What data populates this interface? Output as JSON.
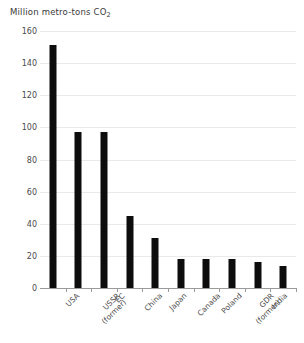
{
  "chart_data": {
    "type": "bar",
    "title": "Million metro-tons CO2",
    "title_prefix": "Million metro-tons CO",
    "title_subscript": "2",
    "xlabel": "",
    "ylabel": "Million metro-tons CO2",
    "ylim": [
      0,
      160
    ],
    "ytick_values": [
      0,
      20,
      40,
      60,
      80,
      100,
      120,
      140,
      160
    ],
    "ytick_labels": [
      "0",
      "20",
      "40",
      "60",
      "80",
      "100",
      "120",
      "140",
      "160"
    ],
    "grid": true,
    "legend": "none",
    "categories": [
      "USA",
      "USSR (former)",
      "EC",
      "China",
      "Japan",
      "Canada",
      "Poland",
      "GDR (former)",
      "India",
      "Czechoslovakia (former)"
    ],
    "category_lines": [
      [
        "USA"
      ],
      [
        "USSR",
        "(former)"
      ],
      [
        "EC"
      ],
      [
        "China"
      ],
      [
        "Japan"
      ],
      [
        "Canada"
      ],
      [
        "Poland"
      ],
      [
        "GDR",
        "(former)"
      ],
      [
        "India"
      ],
      [
        "Czechoslovakia",
        "(former)"
      ]
    ],
    "values": [
      151,
      97,
      97,
      45,
      31,
      18,
      18,
      18,
      16,
      14
    ],
    "bar_color": "#0d0d0d",
    "grid_color": "#e9e9e9",
    "axis_color": "#9a9a9a",
    "text_color": "#4a4a4a"
  }
}
